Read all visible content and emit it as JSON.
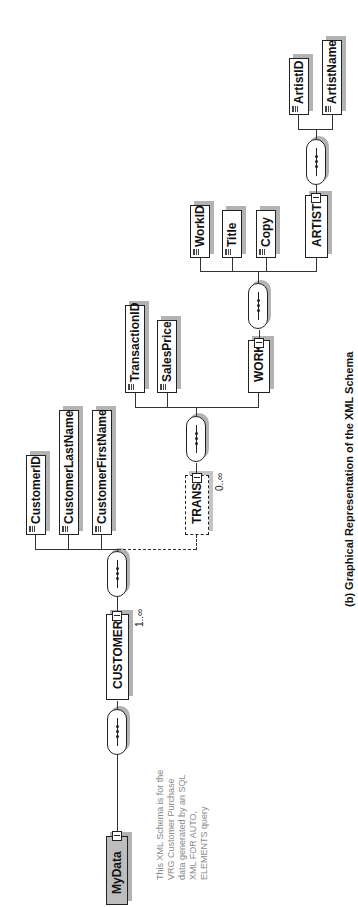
{
  "diagram": {
    "caption": "(b) Graphical Representation of the XML Schema",
    "annotation": "This XML Schema is for the\nVRG Customer Purchase\ndata generated by an SQL\nXML FOR AUTO,\nELEMENTS query",
    "root": {
      "label": "MyData"
    },
    "customer": {
      "label": "CUSTOMER",
      "cardinality": "1..∞"
    },
    "customer_children": [
      {
        "label": "CustomerID"
      },
      {
        "label": "CustomerLastName"
      },
      {
        "label": "CustomerFirstName"
      }
    ],
    "trans": {
      "label": "TRANS",
      "cardinality": "0..∞"
    },
    "trans_children": [
      {
        "label": "TransactionID"
      },
      {
        "label": "SalesPrice"
      }
    ],
    "work": {
      "label": "WORK"
    },
    "work_children": [
      {
        "label": "WorkID"
      },
      {
        "label": "Title"
      },
      {
        "label": "Copy"
      }
    ],
    "artist": {
      "label": "ARTIST"
    },
    "artist_children": [
      {
        "label": "ArtistID"
      },
      {
        "label": "ArtistName"
      }
    ],
    "compositor_icon": "sequence-compositor-icon",
    "colors": {
      "root_fill": "#bdbdbd",
      "shadow": "#b3b3b3",
      "line": "#222222",
      "annotation_text": "#8a8a8a"
    }
  }
}
